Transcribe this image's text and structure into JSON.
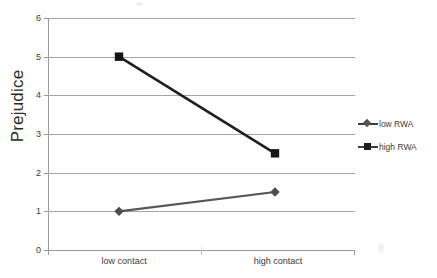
{
  "chart_data": {
    "type": "line",
    "title": "",
    "xlabel": "",
    "ylabel": "Prejudice",
    "categories": [
      "low contact",
      "high contact"
    ],
    "ylim": [
      0,
      6
    ],
    "yticks": [
      0,
      1,
      2,
      3,
      4,
      5,
      6
    ],
    "ytick_labels": [
      "0",
      "1",
      "2",
      "3",
      "4",
      "5",
      "6"
    ],
    "grid": true,
    "legend_position": "right",
    "series": [
      {
        "name": "low RWA",
        "marker": "diamond",
        "color": "#555555",
        "values": [
          1.0,
          1.5
        ]
      },
      {
        "name": "high RWA",
        "marker": "square",
        "color": "#1c1c1c",
        "values": [
          5.0,
          2.5
        ]
      }
    ]
  },
  "axis": {
    "y_title": "Prejudice",
    "y_tick_6": "6",
    "y_tick_5": "5",
    "y_tick_4": "4",
    "y_tick_3": "3",
    "y_tick_2": "2",
    "y_tick_1": "1",
    "y_tick_0": "0",
    "x_tick_low": "low contact",
    "x_tick_high": "high contact"
  },
  "legend": {
    "items": [
      {
        "label": "low RWA"
      },
      {
        "label": "high RWA"
      }
    ]
  }
}
